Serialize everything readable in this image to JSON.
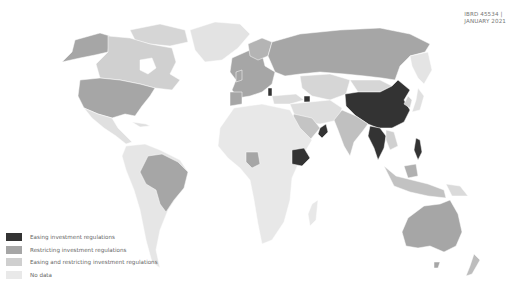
{
  "reference": {
    "code": "IBRD 45534 |",
    "date": "JANUARY 2021"
  },
  "legend": {
    "items": [
      {
        "label": "Easing investment regulations",
        "color": "#333333"
      },
      {
        "label": "Restricting investment regulations",
        "color": "#a6a6a6"
      },
      {
        "label": "Easing and restricting investment regulations",
        "color": "#cfcfcf"
      },
      {
        "label": "No data",
        "color": "#e9e9e9"
      }
    ]
  },
  "map": {
    "categories": {
      "easing": [
        "China",
        "Ethiopia",
        "Oman",
        "Myanmar",
        "Thailand",
        "Philippines",
        "Serbia",
        "Azerbaijan",
        "Malaysia"
      ],
      "restricting": [
        "United States",
        "Alaska (US)",
        "Brazil",
        "Russia",
        "Australia",
        "Nigeria",
        "European Union countries",
        "India",
        "Indonesia",
        "New Zealand",
        "Japan",
        "Saudi Arabia"
      ],
      "easing_and_restricting": [
        "Canada",
        "Kazakhstan",
        "Mongolia",
        "Vietnam",
        "Greenland"
      ],
      "no_data": [
        "Africa (most)",
        "South America (most)",
        "Central America",
        "Middle East (parts)",
        "Central Asia (parts)"
      ]
    }
  }
}
